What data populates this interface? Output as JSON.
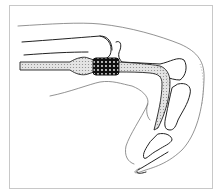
{
  "figure": {
    "colors": {
      "line": "#222222",
      "tendon_fill": "#d9d9d9",
      "junction_fill": "#1a1a1a",
      "frame": "#c8c8c8",
      "background": "#ffffff"
    }
  }
}
